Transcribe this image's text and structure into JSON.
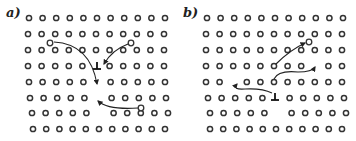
{
  "figure": {
    "panels": [
      {
        "label": "a)",
        "label_pos": [
          6,
          17
        ],
        "rows": [
          {
            "y": 18,
            "x0": 29,
            "dx": 13.6,
            "count": 11,
            "gaps": []
          },
          {
            "y": 34,
            "x0": 28,
            "dx": 13.6,
            "count": 11,
            "gaps": []
          },
          {
            "y": 50,
            "x0": 28,
            "dx": 13.6,
            "count": 11,
            "gaps": []
          },
          {
            "y": 66,
            "x0": 28,
            "dx": 13.6,
            "count": 11,
            "gaps": [
              5
            ]
          },
          {
            "y": 82,
            "x0": 29,
            "dx": 13.6,
            "count": 11,
            "gaps": [
              5
            ]
          },
          {
            "y": 98,
            "x0": 30,
            "dx": 13.6,
            "count": 11,
            "gaps": [
              5
            ]
          },
          {
            "y": 113,
            "x0": 32,
            "dx": 13.6,
            "count": 11,
            "gaps": [
              5
            ]
          },
          {
            "y": 129,
            "x0": 33,
            "dx": 13.2,
            "count": 11,
            "gaps": []
          }
        ],
        "free_atoms": [
          [
            50,
            43
          ],
          [
            131,
            43
          ],
          [
            141,
            108
          ]
        ],
        "dislocation": {
          "x": 97,
          "y": 66,
          "symbol": "⊥"
        },
        "arrows": [
          {
            "d": "M 54 42 Q 90 44 97 84",
            "head": [
              97,
              86
            ]
          },
          {
            "d": "M 128 44 Q 112 50 104 64",
            "head": [
              101,
              66
            ]
          },
          {
            "d": "M 138 108 Q 108 110 98 101",
            "head": [
              97,
              100
            ]
          }
        ]
      },
      {
        "label": "b)",
        "label_pos": [
          183,
          17
        ],
        "rows": [
          {
            "y": 18,
            "x0": 207,
            "dx": 13.6,
            "count": 11,
            "gaps": []
          },
          {
            "y": 34,
            "x0": 206,
            "dx": 13.6,
            "count": 11,
            "gaps": []
          },
          {
            "y": 50,
            "x0": 206,
            "dx": 13.6,
            "count": 11,
            "gaps": []
          },
          {
            "y": 66,
            "x0": 206,
            "dx": 13.6,
            "count": 11,
            "gaps": [
              8
            ]
          },
          {
            "y": 82,
            "x0": 206,
            "dx": 13.6,
            "count": 11,
            "gaps": [
              2
            ]
          },
          {
            "y": 98,
            "x0": 208,
            "dx": 13.6,
            "count": 11,
            "gaps": [
              5
            ]
          },
          {
            "y": 113,
            "x0": 210,
            "dx": 13.6,
            "count": 11,
            "gaps": [
              5
            ]
          },
          {
            "y": 129,
            "x0": 210,
            "dx": 13.2,
            "count": 11,
            "gaps": []
          }
        ],
        "free_atoms": [
          [
            309,
            42
          ]
        ],
        "dislocation": {
          "x": 275,
          "y": 97,
          "symbol": "⊥"
        },
        "arrows": [
          {
            "d": "M 276 64 Q 290 50 305 43",
            "head": [
              306,
              42
            ]
          },
          {
            "d": "M 274 79 Q 278 70 298 72 Q 312 72 315 67",
            "head": [
              316,
              66
            ]
          },
          {
            "d": "M 272 93 Q 262 88 245 89 Q 232 90 237 84",
            "head": [
              236,
              84
            ]
          }
        ]
      }
    ]
  }
}
